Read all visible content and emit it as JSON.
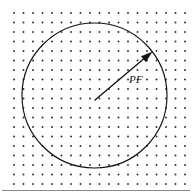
{
  "figure": {
    "background_color": "#ffffff",
    "ink_color": "#111111",
    "dot_color": "#2a2a2a",
    "frame_color": "#8a8a8a",
    "width": 192,
    "height": 192
  },
  "lattice": {
    "name": "point-lattice",
    "origin_x": 14,
    "origin_y": 13,
    "spacing_x": 9.5,
    "spacing_y": 9.5,
    "columns": 19,
    "rows": 19,
    "dot_radius": 0.95
  },
  "circle": {
    "center_x": 94.5,
    "center_y": 95.5,
    "radius": 72.5,
    "stroke_width": 1.15
  },
  "radius_vector": {
    "label": "PF",
    "label_x": 129,
    "label_y": 83,
    "start_x": 95,
    "start_y": 100,
    "end_x": 152,
    "end_y": 52,
    "arrow_head_length": 11,
    "arrow_head_width": 7
  },
  "frame": {
    "bottom_line_y": 190.5,
    "bottom_line_x1": 2,
    "bottom_line_x2": 190
  }
}
